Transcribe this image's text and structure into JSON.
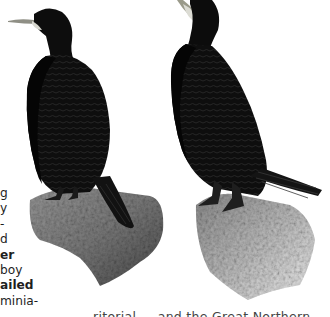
{
  "page": {
    "type": "book page excerpt",
    "illustration": {
      "subject": "two cormorants (shags) perched on rocks",
      "figures": [
        {
          "name": "left-bird",
          "description": "cormorant facing left, long pale-tipped bill, perched on grey rock"
        },
        {
          "name": "right-bird",
          "description": "cormorant with head turned upward, white throat patch, long tail fanned, perched on grey rock"
        }
      ],
      "colors": {
        "plumage": "#0d0d0d",
        "plumage_sheen": "#2a2a2a",
        "rock_dark": "#6e6e6e",
        "rock_light": "#c8c8c8",
        "bill": "#9a9a8a",
        "throat": "#d8d8d0"
      }
    },
    "left_column_fragments": [
      {
        "text": "g",
        "bold": false
      },
      {
        "text": "y",
        "bold": false
      },
      {
        "text": "-",
        "bold": false
      },
      {
        "text": "d",
        "bold": false
      },
      {
        "text": "er",
        "bold": true
      },
      {
        "text": "boy",
        "bold": false
      },
      {
        "text": "ailed",
        "bold": true
      },
      {
        "text": "minia-",
        "bold": false
      }
    ],
    "bottom_line_fragment": "ritorial ... and the Great Northern"
  }
}
